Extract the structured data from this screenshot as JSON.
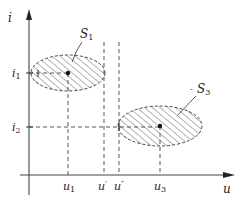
{
  "diagram": {
    "axes": {
      "x_label": "u",
      "y_label": "i"
    },
    "y_ticks": [
      {
        "label_main": "i",
        "label_sub": "1"
      },
      {
        "label_main": "i",
        "label_sub": "2"
      }
    ],
    "x_ticks": [
      {
        "label_main": "u",
        "label_sub": "1"
      },
      {
        "label_main": "u",
        "label_sub": "′"
      },
      {
        "label_main": "u",
        "label_sub": "″"
      },
      {
        "label_main": "u",
        "label_sub": "3"
      }
    ],
    "regions": [
      {
        "label_main": "S",
        "label_sub": "1"
      },
      {
        "label_main": "S",
        "label_sub": "3"
      }
    ],
    "colors": {
      "stroke": "#333333",
      "hatch": "#555555",
      "background": "#ffffff"
    }
  }
}
